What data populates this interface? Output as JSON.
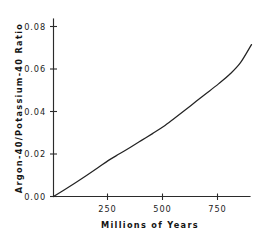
{
  "figure": {
    "background_color": "#ffffff",
    "ink_color": "#232323"
  },
  "chart_data": {
    "type": "line",
    "title": "",
    "subtitle": "",
    "xlabel": "Millions of Years",
    "ylabel": "Argon-40/Potassium-40 Ratio",
    "xlim": [
      0,
      900
    ],
    "ylim": [
      0.0,
      0.085
    ],
    "grid": false,
    "legend": null,
    "legend_position": "none",
    "xticks": [
      250,
      500,
      750
    ],
    "xtick_labels": [
      "250",
      "500",
      "750"
    ],
    "yticks": [
      0.0,
      0.02,
      0.04,
      0.06,
      0.08
    ],
    "ytick_labels": [
      "0.00",
      "0.02",
      "0.04",
      "0.06",
      "0.08"
    ],
    "series": [
      {
        "name": "Argon-40/Potassium-40 Ratio",
        "color": "#232323",
        "x": [
          0,
          50,
          100,
          150,
          200,
          250,
          300,
          350,
          400,
          450,
          500,
          550,
          600,
          650,
          700,
          750,
          800,
          850,
          900
        ],
        "values": [
          0.0,
          0.0032,
          0.0065,
          0.0099,
          0.0134,
          0.017,
          0.0201,
          0.0232,
          0.0264,
          0.0296,
          0.0329,
          0.0368,
          0.0408,
          0.0449,
          0.0489,
          0.053,
          0.0574,
          0.063,
          0.0715
        ]
      }
    ],
    "annotations": []
  },
  "axes": {
    "x_axis_name": "Millions of Years",
    "y_axis_name": "Argon-40/Potassium-40 Ratio"
  }
}
